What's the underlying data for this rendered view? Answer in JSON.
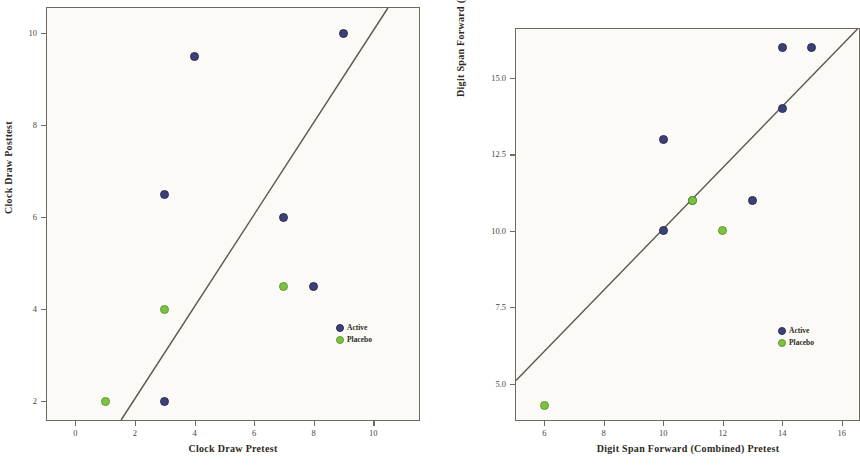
{
  "figure": {
    "panels": [
      {
        "id": "clock-draw",
        "xlabel": "Clock Draw Pretest",
        "ylabel": "Clock Draw Posttest",
        "legend": {
          "active": "Active",
          "placebo": "Placebo"
        }
      },
      {
        "id": "digit-span-forward",
        "xlabel": "Digit Span Forward (Combined) Pretest",
        "ylabel": "Digit Span Forward (Combined) Posttest",
        "legend": {
          "active": "Active",
          "placebo": "Placebo"
        }
      }
    ],
    "colors": {
      "active": "#3d3f77",
      "placebo": "#7cc242",
      "axis": "#6e6a5e",
      "reference_line": "#5b584d",
      "plot_background": "#fbfaf7"
    }
  },
  "chart_data": [
    {
      "type": "scatter",
      "title": "",
      "xlabel": "Clock Draw Pretest",
      "ylabel": "Clock Draw Posttest",
      "xlim": [
        -0.95,
        11.6
      ],
      "ylim": [
        1.55,
        10.55
      ],
      "xticks": [
        0,
        2,
        4,
        6,
        8,
        10
      ],
      "yticks": [
        2,
        4,
        6,
        8,
        10
      ],
      "xticklabels": [
        "0",
        "2",
        "4",
        "6",
        "8",
        "10"
      ],
      "yticklabels": [
        "2",
        "4",
        "6",
        "8",
        "10"
      ],
      "grid": false,
      "legend_position": "lower right",
      "reference_line": {
        "type": "identity",
        "slope": 1,
        "intercept": 0,
        "label": ""
      },
      "series": [
        {
          "name": "Active",
          "color": "#3d3f77",
          "points": [
            {
              "x": 3,
              "y": 2
            },
            {
              "x": 3,
              "y": 6.5
            },
            {
              "x": 4,
              "y": 9.5
            },
            {
              "x": 7,
              "y": 6
            },
            {
              "x": 8,
              "y": 4.5
            },
            {
              "x": 9,
              "y": 10
            }
          ]
        },
        {
          "name": "Placebo",
          "color": "#7cc242",
          "points": [
            {
              "x": 1,
              "y": 2
            },
            {
              "x": 3,
              "y": 4
            },
            {
              "x": 7,
              "y": 4.5
            }
          ]
        }
      ]
    },
    {
      "type": "scatter",
      "title": "",
      "xlabel": "Digit Span Forward (Combined) Pretest",
      "ylabel": "Digit Span Forward (Combined) Posttest",
      "xlim": [
        5.05,
        16.65
      ],
      "ylim": [
        3.75,
        16.6
      ],
      "xticks": [
        6,
        8,
        10,
        12,
        14,
        16
      ],
      "yticks": [
        5.0,
        7.5,
        10.0,
        12.5,
        15.0
      ],
      "xticklabels": [
        "6",
        "8",
        "10",
        "12",
        "14",
        "16"
      ],
      "yticklabels": [
        "5.0",
        "7.5",
        "10.0",
        "12.5",
        "15.0"
      ],
      "grid": false,
      "legend_position": "lower right",
      "reference_line": {
        "type": "identity",
        "slope": 1,
        "intercept": 0,
        "label": ""
      },
      "series": [
        {
          "name": "Active",
          "color": "#3d3f77",
          "points": [
            {
              "x": 10,
              "y": 10
            },
            {
              "x": 10,
              "y": 13
            },
            {
              "x": 11,
              "y": 11
            },
            {
              "x": 13,
              "y": 11
            },
            {
              "x": 14,
              "y": 14
            },
            {
              "x": 14,
              "y": 16
            },
            {
              "x": 15,
              "y": 16
            }
          ]
        },
        {
          "name": "Placebo",
          "color": "#7cc242",
          "points": [
            {
              "x": 6,
              "y": 4.3
            },
            {
              "x": 11,
              "y": 11
            },
            {
              "x": 12,
              "y": 10
            }
          ]
        }
      ]
    }
  ]
}
